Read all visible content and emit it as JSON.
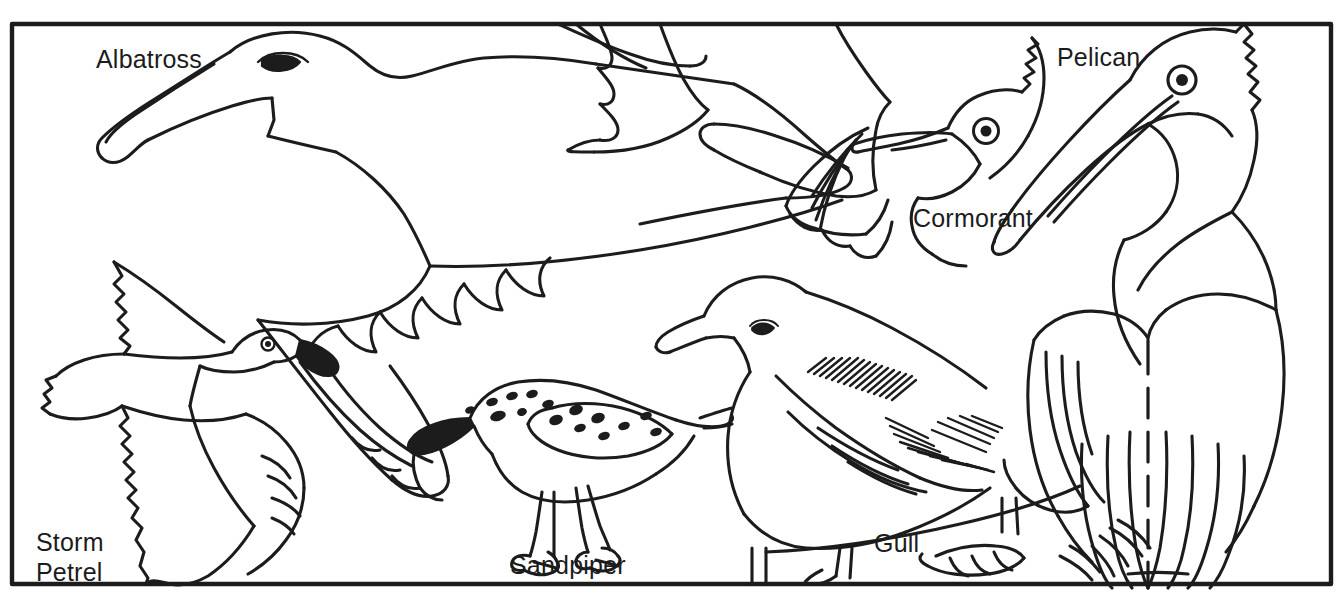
{
  "illustration": {
    "title": "Seabirds identification line drawing",
    "style": "black-and-white coloring-book line art",
    "background_color": "#ffffff",
    "ink_color": "#1c1c1c",
    "border": {
      "present": true,
      "shape": "rectangle",
      "stroke_color": "#1c1c1c",
      "stroke_width": 4
    }
  },
  "labels": {
    "albatross": "Albatross",
    "pelican": "Pelican",
    "cormorant": "Cormorant",
    "gull": "Gull",
    "sandpiper": "Sandpiper",
    "storm_petrel_line1": "Storm",
    "storm_petrel_line2": "Petrel"
  },
  "birds": [
    {
      "name": "Albatross",
      "label": "Albatross",
      "position": "upper-left",
      "pose": "gliding in flight, head left, long wings spread",
      "features": [
        "long hooked tubenose bill",
        "dark oval eye",
        "scalloped wing feathers"
      ]
    },
    {
      "name": "Storm Petrel",
      "label": "Storm Petrel",
      "position": "lower-left",
      "pose": "flying toward viewer, wings spread up and down",
      "features": [
        "small dark hooked bill",
        "round eye",
        "notched tail",
        "ragged wing edges"
      ]
    },
    {
      "name": "Sandpiper",
      "label": "Sandpiper",
      "position": "bottom-center",
      "pose": "standing, head bent down, probing",
      "features": [
        "long dark straight bill",
        "spotted back and crown",
        "thin long legs",
        "three-toed feet"
      ]
    },
    {
      "name": "Gull",
      "label": "Gull",
      "position": "center-right",
      "pose": "standing, head left, wings folded",
      "features": [
        "stout yellow-style bill",
        "small eye",
        "hatched dark wing shading",
        "webbed feet"
      ]
    },
    {
      "name": "Cormorant",
      "label": "Cormorant",
      "position": "upper-right-center",
      "pose": "head and neck raised, body behind pelican",
      "features": [
        "long hooked bill",
        "ringed circular eye",
        "crested nape",
        "spread wing with fingered primaries"
      ]
    },
    {
      "name": "Pelican",
      "label": "Pelican",
      "position": "right",
      "pose": "standing large, head left, huge bill and pouch",
      "features": [
        "very long pouched bill",
        "ringed circular eye",
        "shaggy crest",
        "dashed wing fold line",
        "long folded wing feathers"
      ]
    }
  ]
}
